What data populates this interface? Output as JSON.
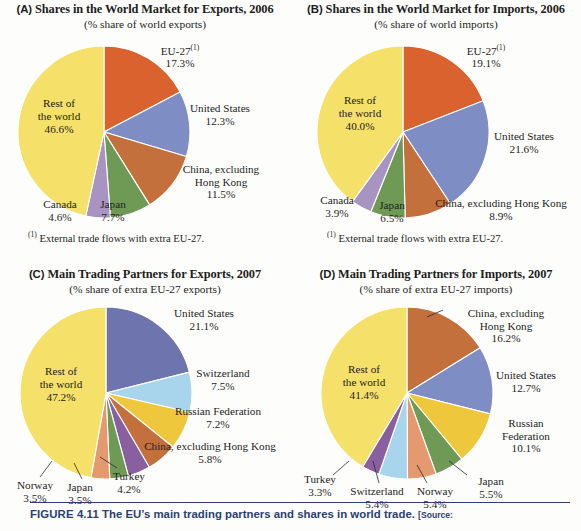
{
  "figure": {
    "caption_tag": "FIGURE 4.11",
    "caption_text": "The EU’s main trading partners and shares in world trade.",
    "caption_source": "[Source:"
  },
  "colors": {
    "eu27_orange": "#D9622F",
    "us_blue": "#7E8EC4",
    "us_blue_dark": "#6E75AE",
    "china_brown": "#C4703C",
    "japan_green": "#6E9A56",
    "canada_purple": "#A894C0",
    "rest_yellow": "#F5E06A",
    "swiss_lightblue": "#A8D4EC",
    "russia_gold": "#EFC73C",
    "turkey_purple": "#8A5FA0",
    "norway_salmon": "#E49A6E"
  },
  "panels": [
    {
      "id": "A",
      "letter": "(A)",
      "title": "Shares in the World Market for Exports, 2006",
      "subtitle": "(% share of world exports)",
      "footnote": "External trade flows with extra EU-27.",
      "footnote_marker": "(1)",
      "chart_data": {
        "type": "pie",
        "title": "Shares in the World Market for Exports, 2006",
        "unit": "% share of world exports",
        "labels": [
          "EU-27",
          "United States",
          "China, excluding Hong Kong",
          "Japan",
          "Canada",
          "Rest of the world"
        ],
        "values": [
          17.3,
          12.3,
          11.5,
          7.7,
          4.6,
          46.6
        ],
        "value_labels": [
          "17.3%",
          "12.3%",
          "11.5%",
          "7.7%",
          "4.6%",
          "46.6%"
        ],
        "colors": [
          "#D9622F",
          "#7E8EC4",
          "#C4703C",
          "#6E9A56",
          "#A894C0",
          "#F5E06A"
        ],
        "start_angle_deg": 0,
        "legend": "labels-on-chart"
      },
      "labels": [
        {
          "name": "eu27",
          "line1": "EU-27",
          "sup": "(1)",
          "line2": "17.3%"
        },
        {
          "name": "united-states",
          "line1": "United States",
          "line2": "12.3%"
        },
        {
          "name": "china",
          "line1": "China, excluding",
          "line2": "Hong Kong",
          "line3": "11.5%"
        },
        {
          "name": "japan",
          "line1": "Japan",
          "line2": "7.7%"
        },
        {
          "name": "canada",
          "line1": "Canada",
          "line2": "4.6%"
        },
        {
          "name": "rest-of-world",
          "line1": "Rest of",
          "line2": "the world",
          "line3": "46.6%"
        }
      ]
    },
    {
      "id": "B",
      "letter": "(B)",
      "title": "Shares in the World Market for Imports, 2006",
      "subtitle": "(% share of world imports)",
      "footnote": "External trade flows with extra EU-27.",
      "footnote_marker": "(1)",
      "chart_data": {
        "type": "pie",
        "title": "Shares in the World Market for Imports, 2006",
        "unit": "% share of world imports",
        "labels": [
          "EU-27",
          "United States",
          "China, excluding Hong Kong",
          "Japan",
          "Canada",
          "Rest of the world"
        ],
        "values": [
          19.1,
          21.6,
          8.9,
          6.5,
          3.9,
          40.0
        ],
        "value_labels": [
          "19.1%",
          "21.6%",
          "8.9%",
          "6.5%",
          "3.9%",
          "40.0%"
        ],
        "colors": [
          "#D9622F",
          "#7E8EC4",
          "#C4703C",
          "#6E9A56",
          "#A894C0",
          "#F5E06A"
        ],
        "start_angle_deg": 0,
        "legend": "labels-on-chart"
      },
      "labels": [
        {
          "name": "eu27",
          "line1": "EU-27",
          "sup": "(1)",
          "line2": "19.1%"
        },
        {
          "name": "united-states",
          "line1": "United States",
          "line2": "21.6%"
        },
        {
          "name": "china",
          "line1": "China, excluding Hong Kong",
          "line2": "8.9%"
        },
        {
          "name": "japan",
          "line1": "Japan",
          "line2": "6.5%"
        },
        {
          "name": "canada",
          "line1": "Canada",
          "line2": "3.9%"
        },
        {
          "name": "rest-of-world",
          "line1": "Rest of",
          "line2": "the world",
          "line3": "40.0%"
        }
      ]
    },
    {
      "id": "C",
      "letter": "(C)",
      "title": "Main Trading Partners for Exports, 2007",
      "subtitle": "(% share of extra EU-27 exports)",
      "footnote": "",
      "footnote_marker": "",
      "chart_data": {
        "type": "pie",
        "title": "Main Trading Partners for Exports, 2007",
        "unit": "% share of extra EU-27 exports",
        "labels": [
          "United States",
          "Switzerland",
          "Russian Federation",
          "China, excluding Hong Kong",
          "Turkey",
          "Japan",
          "Norway",
          "Rest of the world"
        ],
        "values": [
          21.1,
          7.5,
          7.2,
          5.8,
          4.2,
          3.5,
          3.5,
          47.2
        ],
        "value_labels": [
          "21.1%",
          "7.5%",
          "7.2%",
          "5.8%",
          "4.2%",
          "3.5%",
          "3.5%",
          "47.2%"
        ],
        "colors": [
          "#6E75AE",
          "#A8D4EC",
          "#EFC73C",
          "#C4703C",
          "#8A5FA0",
          "#6E9A56",
          "#E49A6E",
          "#F5E06A"
        ],
        "start_angle_deg": 0,
        "legend": "labels-on-chart"
      },
      "labels": [
        {
          "name": "united-states",
          "line1": "United States",
          "line2": "21.1%"
        },
        {
          "name": "switzerland",
          "line1": "Switzerland",
          "line2": "7.5%"
        },
        {
          "name": "russian-federation",
          "line1": "Russian Federation",
          "line2": "7.2%"
        },
        {
          "name": "china",
          "line1": "China, excluding Hong Kong",
          "line2": "5.8%"
        },
        {
          "name": "turkey",
          "line1": "Turkey",
          "line2": "4.2%"
        },
        {
          "name": "japan",
          "line1": "Japan",
          "line2": "3.5%"
        },
        {
          "name": "norway",
          "line1": "Norway",
          "line2": "3.5%"
        },
        {
          "name": "rest-of-world",
          "line1": "Rest of",
          "line2": "the world",
          "line3": "47.2%"
        }
      ]
    },
    {
      "id": "D",
      "letter": "(D)",
      "title": "Main Trading Partners for Imports, 2007",
      "subtitle": "(% share of extra EU-27 imports)",
      "footnote": "",
      "footnote_marker": "",
      "chart_data": {
        "type": "pie",
        "title": "Main Trading Partners for Imports, 2007",
        "unit": "% share of extra EU-27 imports",
        "labels": [
          "China, excluding Hong Kong",
          "United States",
          "Russian Federation",
          "Japan",
          "Norway",
          "Switzerland",
          "Turkey",
          "Rest of the world"
        ],
        "values": [
          16.2,
          12.7,
          10.1,
          5.5,
          5.4,
          5.4,
          3.3,
          41.4
        ],
        "value_labels": [
          "16.2%",
          "12.7%",
          "10.1%",
          "5.5%",
          "5.4%",
          "5.4%",
          "3.3%",
          "41.4%"
        ],
        "colors": [
          "#C4703C",
          "#7E8EC4",
          "#EFC73C",
          "#6E9A56",
          "#E49A6E",
          "#A8D4EC",
          "#8A5FA0",
          "#F5E06A"
        ],
        "start_angle_deg": 0,
        "legend": "labels-on-chart"
      },
      "labels": [
        {
          "name": "china",
          "line1": "China, excluding",
          "line2": "Hong Kong",
          "line3": "16.2%"
        },
        {
          "name": "united-states",
          "line1": "United States",
          "line2": "12.7%"
        },
        {
          "name": "russian-federation",
          "line1": "Russian",
          "line2": "Federation",
          "line3": "10.1%"
        },
        {
          "name": "japan",
          "line1": "Japan",
          "line2": "5.5%"
        },
        {
          "name": "norway",
          "line1": "Norway",
          "line2": "5.4%"
        },
        {
          "name": "switzerland",
          "line1": "Switzerland",
          "line2": "5.4%"
        },
        {
          "name": "turkey",
          "line1": "Turkey",
          "line2": "3.3%"
        },
        {
          "name": "rest-of-world",
          "line1": "Rest of",
          "line2": "the world",
          "line3": "41.4%"
        }
      ]
    }
  ]
}
